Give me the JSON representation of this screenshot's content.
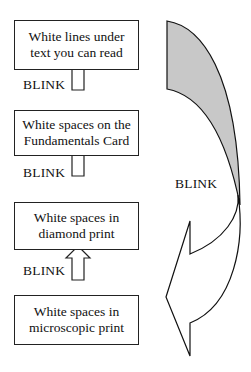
{
  "diagram": {
    "boxes": [
      {
        "id": "top",
        "text": "White lines under text you can read"
      },
      {
        "id": "second",
        "text": "White spaces on the Fundamentals Card"
      },
      {
        "id": "third",
        "text": "White spaces in diamond print"
      },
      {
        "id": "bottom",
        "text": "White spaces in microscopic print"
      }
    ],
    "arrow_labels": [
      "BLINK",
      "BLINK",
      "BLINK"
    ],
    "curved_arrow_label": "BLINK",
    "colors": {
      "curve_fill": "#c8c8c8",
      "stroke": "#111111"
    }
  }
}
